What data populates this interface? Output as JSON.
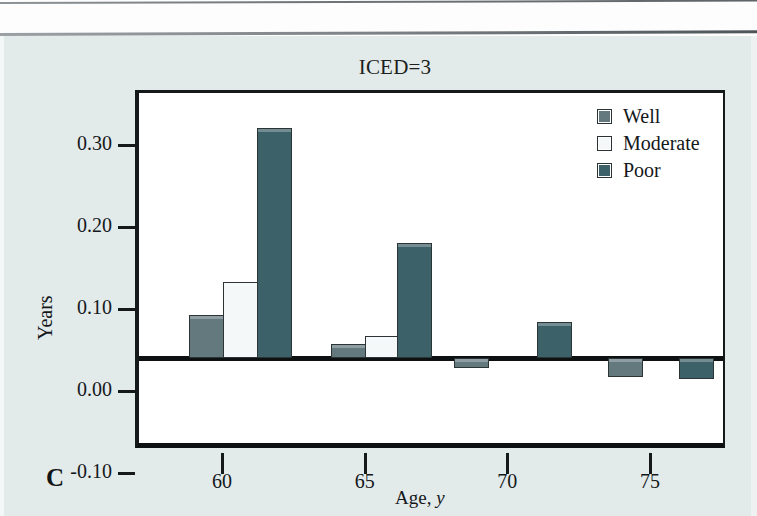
{
  "figure": {
    "panel_label": "C",
    "background_color": "#e3eaea",
    "plot_background_color": "#ffffff",
    "axis_color": "#15191a"
  },
  "legend": {
    "position": "top-right",
    "items": [
      {
        "label": "Well",
        "color": "#63797e",
        "swatch": "filled-square-icon"
      },
      {
        "label": "Moderate",
        "color": "#f4f8f8",
        "swatch": "empty-square-icon"
      },
      {
        "label": "Poor",
        "color": "#3d6169",
        "swatch": "filled-square-icon"
      }
    ]
  },
  "chart_data": {
    "type": "bar",
    "title": "ICED=3",
    "xlabel": "Age, y",
    "ylabel": "Years",
    "xlim": [
      57.2,
      77.8
    ],
    "ylim": [
      -0.1,
      0.335
    ],
    "grid": false,
    "legend_position": "top-right",
    "ytick_labels": [
      "0.30",
      "0.20",
      "0.10",
      "0.00",
      "-0.10"
    ],
    "ytick_values": [
      0.3,
      0.2,
      0.1,
      0.0,
      -0.1
    ],
    "xtick_labels": [
      "60",
      "65",
      "70",
      "75"
    ],
    "xtick_values": [
      60,
      65,
      75,
      75
    ],
    "xticks": [
      60,
      65,
      70,
      75
    ],
    "series": [
      {
        "name": "Well",
        "color": "#63797e",
        "points": [
          {
            "x": 59.3,
            "value": 0.052
          },
          {
            "x": 64.3,
            "value": 0.017
          },
          {
            "x": 68.6,
            "value": -0.012
          },
          {
            "x": 74.0,
            "value": -0.023
          }
        ]
      },
      {
        "name": "Moderate",
        "color": "#f4f8f8",
        "points": [
          {
            "x": 60.5,
            "value": 0.093
          },
          {
            "x": 65.5,
            "value": 0.027
          }
        ]
      },
      {
        "name": "Poor",
        "color": "#3d6169",
        "points": [
          {
            "x": 61.7,
            "value": 0.28
          },
          {
            "x": 66.6,
            "value": 0.14
          },
          {
            "x": 71.5,
            "value": 0.044
          },
          {
            "x": 76.5,
            "value": -0.025
          }
        ]
      }
    ],
    "bars": [
      {
        "series": "Well",
        "x": 59.3,
        "value": 0.052
      },
      {
        "series": "Moderate",
        "x": 60.5,
        "value": 0.093
      },
      {
        "series": "Poor",
        "x": 61.7,
        "value": 0.28
      },
      {
        "series": "Well",
        "x": 64.3,
        "value": 0.017
      },
      {
        "series": "Moderate",
        "x": 65.5,
        "value": 0.027
      },
      {
        "series": "Poor",
        "x": 66.6,
        "value": 0.14
      },
      {
        "series": "Well",
        "x": 68.6,
        "value": -0.012
      },
      {
        "series": "Poor",
        "x": 71.5,
        "value": 0.044
      },
      {
        "series": "Well",
        "x": 74.0,
        "value": -0.023
      },
      {
        "series": "Poor",
        "x": 76.5,
        "value": -0.025
      }
    ]
  }
}
